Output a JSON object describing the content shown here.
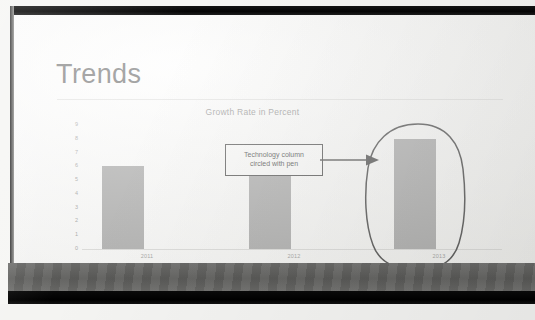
{
  "slide": {
    "title": "Trends"
  },
  "callout": {
    "line1": "Technology column",
    "line2": "circled with pen",
    "arrow_icon": "arrow-right-icon",
    "pen_circle_icon": "pen-ellipse-annotation-icon"
  },
  "chart_data": {
    "type": "bar",
    "title": "Growth Rate in Percent",
    "xlabel": "",
    "ylabel": "",
    "categories": [
      "2011",
      "2012",
      "2013"
    ],
    "series": [
      {
        "name": "Technology",
        "values": [
          6,
          6.2,
          8
        ]
      }
    ],
    "legend": [
      "Technology",
      "Health",
      "Staffing"
    ],
    "legend_position": "bottom",
    "yticks": [
      0,
      1,
      2,
      3,
      4,
      5,
      6,
      7,
      8,
      9
    ],
    "ylim": [
      0,
      9
    ],
    "grid": false,
    "bar_color": "#9d9d9d",
    "axis_color": "#d8d8d6",
    "tick_label_color": "#8d8d8d"
  },
  "colors": {
    "title_text": "#3f3f3f",
    "chart_title_text": "#7c7c7c",
    "callout_border": "#2f2f2f",
    "bezel": "#050505",
    "band_gray": "#5d5d5b"
  }
}
